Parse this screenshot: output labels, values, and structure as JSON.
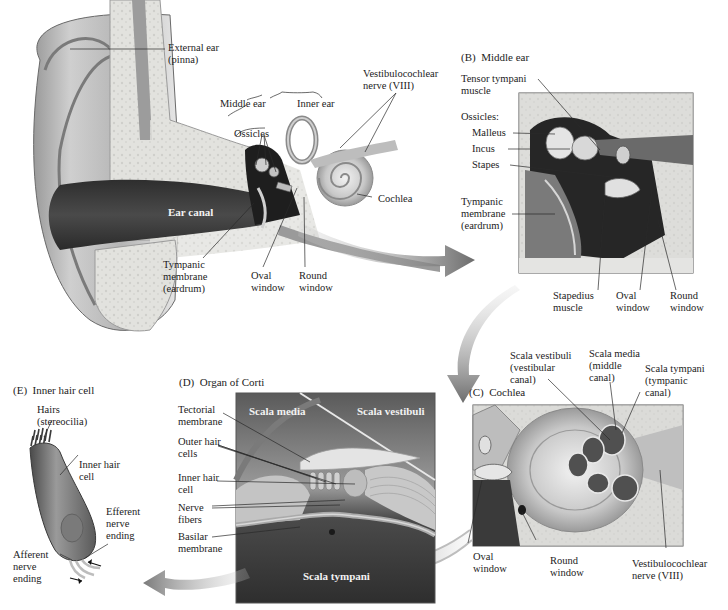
{
  "figure": {
    "panels": [
      {
        "id": "A",
        "title": "",
        "name": "Ear overview"
      },
      {
        "id": "B",
        "title": "(B)  Middle ear"
      },
      {
        "id": "C",
        "title": "(C)  Cochlea"
      },
      {
        "id": "D",
        "title": "(D)  Organ of Corti"
      },
      {
        "id": "E",
        "title": "(E)  Inner hair cell"
      }
    ]
  },
  "panelA": {
    "labels": {
      "external_ear": "External ear\n(pinna)",
      "middle_ear": "Middle ear",
      "inner_ear": "Inner ear",
      "ossicles": "Ossicles",
      "vestibulocochlear": "Vestibulocochlear\nnerve (VIII)",
      "cochlea": "Cochlea",
      "ear_canal": "Ear canal",
      "tympanic": "Tympanic\nmembrane\n(eardrum)",
      "oval_window": "Oval\nwindow",
      "round_window": "Round\nwindow"
    }
  },
  "panelB": {
    "title": "(B)  Middle ear",
    "labels": {
      "tensor_tympani": "Tensor tympani\nmuscle",
      "ossicles": "Ossicles:",
      "malleus": "Malleus",
      "incus": "Incus",
      "stapes": "Stapes",
      "tympanic": "Tympanic\nmembrane\n(eardrum)",
      "stapedius": "Stapedius\nmuscle",
      "oval_window": "Oval\nwindow",
      "round_window": "Round\nwindow"
    }
  },
  "panelC": {
    "title": "(C)  Cochlea",
    "labels": {
      "scala_vestibuli": "Scala vestibuli\n(vestibular\ncanal)",
      "scala_media": "Scala media\n(middle\ncanal)",
      "scala_tympani": "Scala tympani\n(tympanic\ncanal)",
      "oval_window": "Oval\nwindow",
      "round_window": "Round\nwindow",
      "vestibulocochlear": "Vestibulocochlear\nnerve (VIII)"
    }
  },
  "panelD": {
    "title": "(D)  Organ of Corti",
    "labels": {
      "tectorial": "Tectorial\nmembrane",
      "outer_hair": "Outer hair\ncells",
      "inner_hair": "Inner hair\ncell",
      "nerve_fibers": "Nerve\nfibers",
      "basilar": "Basilar\nmembrane"
    },
    "inset_labels": {
      "scala_media": "Scala media",
      "scala_vestibuli": "Scala vestibuli",
      "scala_tympani": "Scala tympani"
    }
  },
  "panelE": {
    "title": "(E)  Inner hair cell",
    "labels": {
      "hairs": "Hairs\n(stereocilia)",
      "inner_hair_cell": "Inner hair\ncell",
      "efferent": "Efferent\nnerve\nending",
      "afferent": "Afferent\nnerve\nending"
    }
  },
  "colors": {
    "background": "#ffffff",
    "text": "#1c1c1c",
    "leader_line": "#2a2a2a",
    "dark_tissue": "#3a3a3a",
    "mid_tissue": "#8a8a8a",
    "light_tissue": "#d8d8d8",
    "bone": "#e4e4e0",
    "arrow": "#8c8c8c",
    "panel_border": "#555555"
  }
}
